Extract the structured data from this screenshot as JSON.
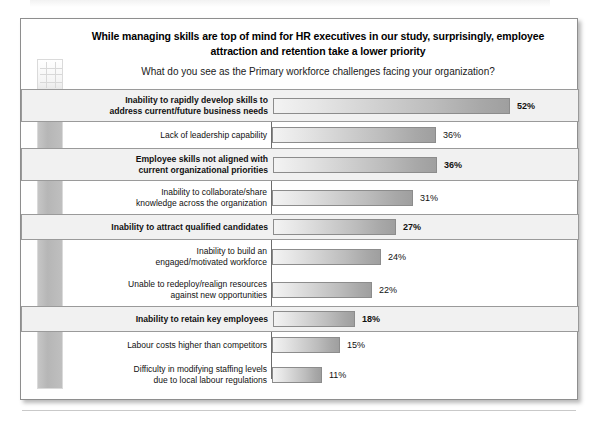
{
  "chart_title": "While managing skills are top of mind for HR executives in our study, surprisingly, employee attraction and retention take a lower priority",
  "chart_subtitle": "What do you see as the Primary workforce challenges facing your organization?",
  "decoration": {
    "strip_name": "vertical-photo-strip"
  },
  "footer": {
    "text": ""
  },
  "colors": {
    "frame_border": "#8e8e8e",
    "axis": "#6d6d6d",
    "bar_light": "#f3f3f3",
    "bar_dark": "#9f9f9f",
    "highlight_fill": "#f1f1f1",
    "highlight_border": "#9a9a9a",
    "text": "#111111"
  },
  "chart_data": {
    "type": "bar",
    "orientation": "horizontal",
    "title": "While managing skills are top of mind for HR executives in our study, surprisingly, employee attraction and retention take a lower priority",
    "subtitle": "What do you see as the Primary workforce challenges facing your organization?",
    "xlabel": "",
    "ylabel": "",
    "xlim": [
      0,
      57
    ],
    "grid": false,
    "legend": null,
    "value_suffix": "%",
    "categories": [
      "Inability to rapidly develop skills to address current/future business needs",
      "Lack of leadership capability",
      "Employee skills not aligned with current organizational priorities",
      "Inability to collaborate/share knowledge across the organization",
      "Inability to attract qualified candidates",
      "Inability to build an engaged/motivated workforce",
      "Unable to redeploy/realign resources against new opportunities",
      "Inability to retain key employees",
      "Labour costs higher than competitors",
      "Difficulty in modifying staffing levels due to local labour regulations"
    ],
    "values": [
      52,
      36,
      36,
      31,
      27,
      24,
      22,
      18,
      15,
      11
    ],
    "value_labels": [
      "52%",
      "36%",
      "36%",
      "31%",
      "27%",
      "24%",
      "22%",
      "18%",
      "15%",
      "11%"
    ],
    "highlighted": [
      true,
      false,
      true,
      false,
      true,
      false,
      false,
      true,
      false,
      false
    ],
    "rows": [
      {
        "label_lines": [
          "Inability to rapidly develop skills to",
          "address current/future business needs"
        ],
        "value": 52,
        "value_label": "52%",
        "highlight": true
      },
      {
        "label_lines": [
          "Lack of leadership capability"
        ],
        "value": 36,
        "value_label": "36%",
        "highlight": false
      },
      {
        "label_lines": [
          "Employee skills not aligned with",
          "current organizational priorities"
        ],
        "value": 36,
        "value_label": "36%",
        "highlight": true
      },
      {
        "label_lines": [
          "Inability to collaborate/share",
          "knowledge across the organization"
        ],
        "value": 31,
        "value_label": "31%",
        "highlight": false
      },
      {
        "label_lines": [
          "Inability to attract qualified candidates"
        ],
        "value": 27,
        "value_label": "27%",
        "highlight": true
      },
      {
        "label_lines": [
          "Inability to build an",
          "engaged/motivated workforce"
        ],
        "value": 24,
        "value_label": "24%",
        "highlight": false
      },
      {
        "label_lines": [
          "Unable to redeploy/realign resources",
          "against new opportunities"
        ],
        "value": 22,
        "value_label": "22%",
        "highlight": false
      },
      {
        "label_lines": [
          "Inability to retain key employees"
        ],
        "value": 18,
        "value_label": "18%",
        "highlight": true
      },
      {
        "label_lines": [
          "Labour costs higher than competitors"
        ],
        "value": 15,
        "value_label": "15%",
        "highlight": false
      },
      {
        "label_lines": [
          "Difficulty in modifying staffing levels",
          "due to local labour regulations"
        ],
        "value": 11,
        "value_label": "11%",
        "highlight": false
      }
    ]
  }
}
